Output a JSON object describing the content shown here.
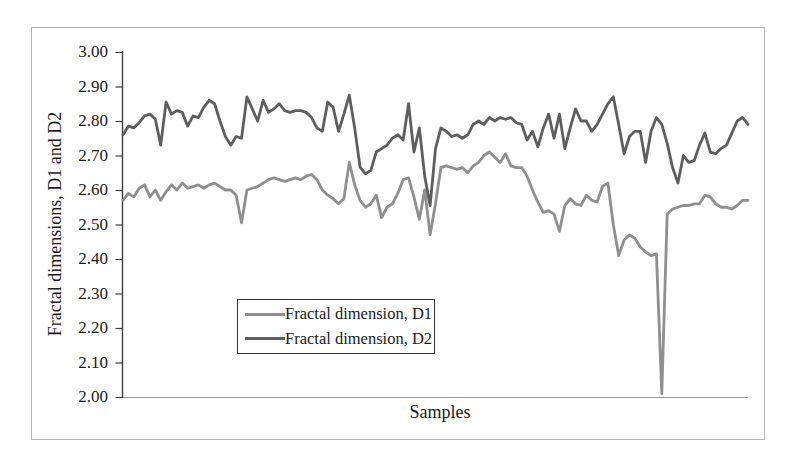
{
  "chart_data": {
    "type": "line",
    "title": "",
    "xlabel": "Samples",
    "ylabel": "Fractal dimensions, D1 and D2",
    "ylim": [
      2.0,
      3.0
    ],
    "ytick_step": 0.1,
    "ytick_labels": [
      "3.00",
      "2.90",
      "2.80",
      "2.70",
      "2.60",
      "2.50",
      "2.40",
      "2.30",
      "2.20",
      "2.10",
      "2.00"
    ],
    "x_axis_ticks": "none (unlabeled sample index)",
    "grid": false,
    "legend_position": "inside, lower center, boxed",
    "axis_color": "#3f3f3f",
    "x_axis_line_color": "#9a9a9a",
    "frame_border_color": "#b5b5b5",
    "series": [
      {
        "name": "Fractal dimension, D1",
        "color": "#8f8f8f",
        "values": [
          2.57,
          2.59,
          2.58,
          2.605,
          2.615,
          2.58,
          2.6,
          2.57,
          2.595,
          2.615,
          2.6,
          2.62,
          2.605,
          2.61,
          2.615,
          2.605,
          2.615,
          2.62,
          2.61,
          2.6,
          2.6,
          2.585,
          2.505,
          2.6,
          2.605,
          2.61,
          2.62,
          2.63,
          2.635,
          2.63,
          2.625,
          2.63,
          2.635,
          2.63,
          2.64,
          2.645,
          2.63,
          2.6,
          2.585,
          2.575,
          2.56,
          2.575,
          2.68,
          2.615,
          2.57,
          2.55,
          2.56,
          2.585,
          2.52,
          2.55,
          2.56,
          2.59,
          2.63,
          2.635,
          2.58,
          2.515,
          2.6,
          2.47,
          2.56,
          2.665,
          2.67,
          2.665,
          2.66,
          2.665,
          2.65,
          2.67,
          2.68,
          2.7,
          2.71,
          2.695,
          2.68,
          2.705,
          2.67,
          2.665,
          2.665,
          2.64,
          2.6,
          2.565,
          2.535,
          2.54,
          2.53,
          2.48,
          2.555,
          2.575,
          2.56,
          2.555,
          2.585,
          2.57,
          2.565,
          2.61,
          2.62,
          2.5,
          2.41,
          2.455,
          2.47,
          2.46,
          2.435,
          2.42,
          2.41,
          2.415,
          2.01,
          2.53,
          2.545,
          2.55,
          2.555,
          2.555,
          2.56,
          2.56,
          2.585,
          2.58,
          2.56,
          2.55,
          2.55,
          2.545,
          2.555,
          2.57,
          2.57
        ]
      },
      {
        "name": "Fractal dimension, D2",
        "color": "#5e5e5e",
        "values": [
          2.76,
          2.785,
          2.78,
          2.795,
          2.815,
          2.82,
          2.805,
          2.73,
          2.855,
          2.82,
          2.83,
          2.825,
          2.785,
          2.815,
          2.81,
          2.84,
          2.86,
          2.85,
          2.8,
          2.755,
          2.73,
          2.755,
          2.75,
          2.87,
          2.835,
          2.8,
          2.86,
          2.825,
          2.835,
          2.85,
          2.83,
          2.825,
          2.83,
          2.83,
          2.825,
          2.81,
          2.78,
          2.77,
          2.855,
          2.84,
          2.77,
          2.82,
          2.875,
          2.78,
          2.666,
          2.647,
          2.657,
          2.71,
          2.72,
          2.73,
          2.75,
          2.76,
          2.745,
          2.85,
          2.71,
          2.78,
          2.64,
          2.555,
          2.72,
          2.78,
          2.77,
          2.755,
          2.76,
          2.75,
          2.76,
          2.79,
          2.8,
          2.79,
          2.81,
          2.8,
          2.81,
          2.805,
          2.81,
          2.795,
          2.79,
          2.745,
          2.77,
          2.725,
          2.78,
          2.82,
          2.75,
          2.82,
          2.72,
          2.78,
          2.835,
          2.8,
          2.8,
          2.77,
          2.79,
          2.82,
          2.85,
          2.87,
          2.79,
          2.705,
          2.755,
          2.77,
          2.77,
          2.68,
          2.77,
          2.81,
          2.79,
          2.735,
          2.665,
          2.62,
          2.7,
          2.68,
          2.685,
          2.73,
          2.765,
          2.71,
          2.705,
          2.72,
          2.73,
          2.765,
          2.8,
          2.81,
          2.79
        ]
      }
    ]
  }
}
